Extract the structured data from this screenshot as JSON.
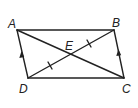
{
  "figure": {
    "type": "parallelogram-with-diagonals",
    "colors": {
      "stroke": "#222222",
      "background": "#ffffff"
    },
    "points": {
      "A": {
        "label": "A",
        "x": 17,
        "y": 30,
        "lx": 8,
        "ly": 28
      },
      "B": {
        "label": "B",
        "x": 114,
        "y": 30,
        "lx": 112,
        "ly": 27
      },
      "C": {
        "label": "C",
        "x": 124,
        "y": 78,
        "lx": 122,
        "ly": 92
      },
      "D": {
        "label": "D",
        "x": 28,
        "y": 78,
        "lx": 19,
        "ly": 92
      },
      "E": {
        "label": "E",
        "x": 70,
        "y": 54,
        "lx": 65,
        "ly": 50
      }
    },
    "segments": [
      "AB",
      "BC",
      "CD",
      "DA",
      "AC",
      "BD"
    ],
    "markings": {
      "parallel_arrows": [
        "AD",
        "BC"
      ],
      "congruent_ticks": [
        "DE",
        "EB"
      ]
    }
  }
}
